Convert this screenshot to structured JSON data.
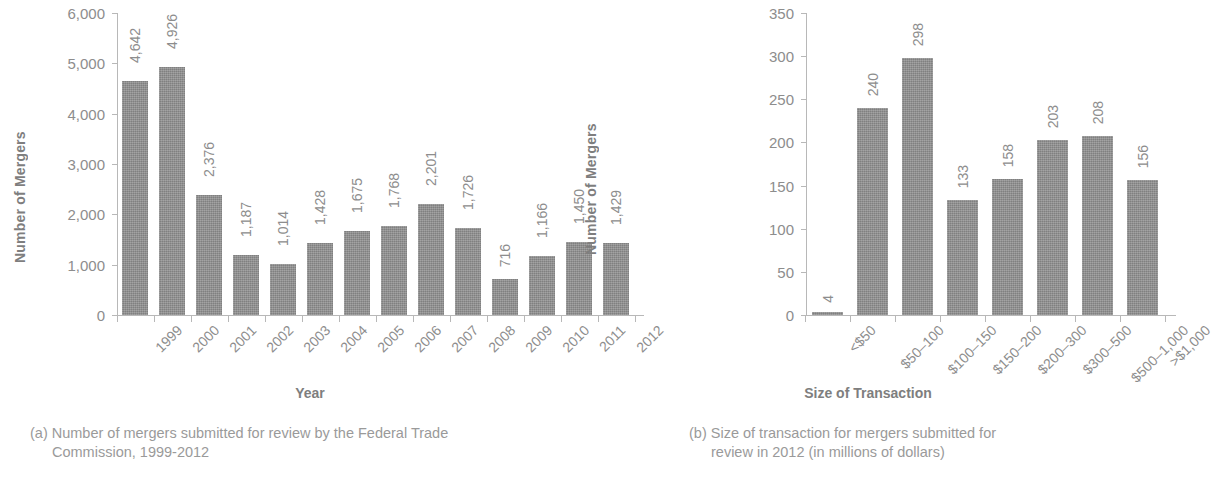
{
  "panel_a": {
    "y_axis_title": "Number of Mergers",
    "x_axis_title": "Year",
    "caption_line1": "(a) Number of mergers submitted for review by the Federal Trade",
    "caption_line2": "Commission, 1999-2012",
    "y_ticks": [
      "0",
      "1,000",
      "2,000",
      "3,000",
      "4,000",
      "5,000",
      "6,000"
    ]
  },
  "panel_b": {
    "y_axis_title": "Number of Mergers",
    "x_axis_title": "Size of Transaction",
    "caption_line1": "(b) Size of transaction for mergers submitted for",
    "caption_line2": "review in 2012 (in millions of dollars)",
    "y_ticks": [
      "0",
      "50",
      "100",
      "150",
      "200",
      "250",
      "300",
      "350"
    ]
  },
  "colors": {
    "bar": "#8f8f8f",
    "axis": "#b8b8b8",
    "text": "#8d8d8d",
    "background": "#ffffff"
  },
  "chart_data": [
    {
      "type": "bar",
      "title": "(a) Number of mergers submitted for review by the Federal Trade Commission, 1999-2012",
      "xlabel": "Year",
      "ylabel": "Number of Mergers",
      "ylim": [
        0,
        6000
      ],
      "ytick_step": 1000,
      "grid": false,
      "legend": "none",
      "bar_labels_shown": true,
      "categories": [
        "1999",
        "2000",
        "2001",
        "2002",
        "2003",
        "2004",
        "2005",
        "2006",
        "2007",
        "2008",
        "2009",
        "2010",
        "2011",
        "2012"
      ],
      "values": [
        4642,
        4926,
        2376,
        1187,
        1014,
        1428,
        1675,
        1768,
        2201,
        1726,
        716,
        1166,
        1450,
        1429
      ],
      "value_labels": [
        "4,642",
        "4,926",
        "2,376",
        "1,187",
        "1,014",
        "1,428",
        "1,675",
        "1,768",
        "2,201",
        "1,726",
        "716",
        "1,166",
        "1,450",
        "1,429"
      ]
    },
    {
      "type": "bar",
      "title": "(b) Size of transaction for mergers submitted for review in 2012 (in millions of dollars)",
      "xlabel": "Size of Transaction",
      "ylabel": "Number of Mergers",
      "ylim": [
        0,
        350
      ],
      "ytick_step": 50,
      "grid": false,
      "legend": "none",
      "bar_labels_shown": true,
      "categories": [
        "<$50",
        "$50–100",
        "$100–150",
        "$150–200",
        "$200–300",
        "$300–500",
        "$500–1,000",
        ">$1,000"
      ],
      "values": [
        4,
        240,
        298,
        133,
        158,
        203,
        208,
        156
      ],
      "value_labels": [
        "4",
        "240",
        "298",
        "133",
        "158",
        "203",
        "208",
        "156"
      ]
    }
  ]
}
